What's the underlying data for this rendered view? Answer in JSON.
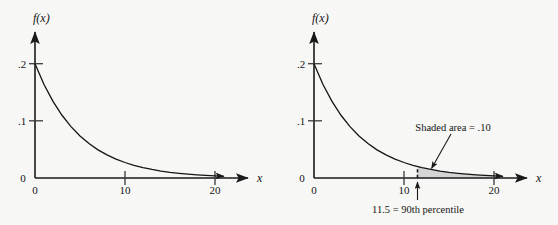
{
  "figure": {
    "background_color": "#f7f7f5",
    "ink_color": "#141414",
    "shade_color": "#cfcfcf"
  },
  "chart_data": [
    {
      "id": "left",
      "type": "line",
      "title": "",
      "xlabel": "x",
      "ylabel": "f(x)",
      "xlim": [
        0,
        22
      ],
      "ylim": [
        0,
        0.225
      ],
      "grid": false,
      "legend": null,
      "x_ticks": [
        0,
        10,
        20
      ],
      "x_tick_labels": [
        "0",
        "10",
        "20"
      ],
      "y_ticks": [
        0,
        0.1,
        0.2
      ],
      "y_tick_labels": [
        "0",
        ".1",
        ".2"
      ],
      "series": [
        {
          "name": "f(x) = .2e^(-.2x)",
          "x": [
            0,
            1,
            2,
            3,
            4,
            5,
            6,
            7,
            8,
            9,
            10,
            11,
            12,
            13,
            14,
            15,
            16,
            17,
            18,
            19,
            20,
            21
          ],
          "y": [
            0.2,
            0.1637,
            0.134,
            0.1098,
            0.0899,
            0.0736,
            0.0602,
            0.0493,
            0.0404,
            0.0331,
            0.0271,
            0.0222,
            0.0181,
            0.0149,
            0.0122,
            0.01,
            0.0082,
            0.0067,
            0.0055,
            0.0045,
            0.0037,
            0.003
          ]
        }
      ],
      "annotations": []
    },
    {
      "id": "right",
      "type": "area",
      "title": "",
      "xlabel": "x",
      "ylabel": "f(x)",
      "xlim": [
        0,
        22
      ],
      "ylim": [
        0,
        0.225
      ],
      "grid": false,
      "legend": null,
      "x_ticks": [
        0,
        10,
        20
      ],
      "x_tick_labels": [
        "0",
        "10",
        "20"
      ],
      "y_ticks": [
        0,
        0.1,
        0.2
      ],
      "y_tick_labels": [
        "0",
        ".1",
        ".2"
      ],
      "series": [
        {
          "name": "f(x) = .2e^(-.2x)",
          "x": [
            0,
            1,
            2,
            3,
            4,
            5,
            6,
            7,
            8,
            9,
            10,
            11,
            12,
            13,
            14,
            15,
            16,
            17,
            18,
            19,
            20,
            21
          ],
          "y": [
            0.2,
            0.1637,
            0.134,
            0.1098,
            0.0899,
            0.0736,
            0.0602,
            0.0493,
            0.0404,
            0.0331,
            0.0271,
            0.0222,
            0.0181,
            0.0149,
            0.0122,
            0.01,
            0.0082,
            0.0067,
            0.0055,
            0.0045,
            0.0037,
            0.003
          ]
        }
      ],
      "shaded_region": {
        "x_from": 11.5,
        "x_to": 21,
        "area": 0.1,
        "label": "Shaded area = .10"
      },
      "annotations": [
        {
          "name": "shaded-area-callout",
          "text": "Shaded area = .10"
        },
        {
          "name": "percentile-callout",
          "text": "11.5 = 90th percentile"
        }
      ],
      "marker_line": {
        "x": 11.5,
        "style": "dashed"
      }
    }
  ],
  "labels": {
    "y_axis": "f(x)",
    "x_axis": "x",
    "y_zero": "0",
    "y_tick_1": ".1",
    "y_tick_2": ".2",
    "x_zero": "0",
    "x_tick_10": "10",
    "x_tick_20": "20",
    "shaded_area": "Shaded area = .10",
    "percentile": "11.5 = 90th percentile"
  }
}
